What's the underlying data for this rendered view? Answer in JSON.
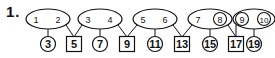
{
  "problem": {
    "number": "1."
  },
  "colors": {
    "ink": "#111111",
    "background": "#ffffff"
  },
  "ovals": [
    {
      "cx": 48,
      "left": "1",
      "right": "2",
      "left_circled": false,
      "right_circled": false
    },
    {
      "cx": 100,
      "left": "3",
      "right": "4",
      "left_circled": false,
      "right_circled": false
    },
    {
      "cx": 155,
      "left": "5",
      "right": "6",
      "left_circled": false,
      "right_circled": false
    },
    {
      "cx": 210,
      "left": "7",
      "right": "8",
      "left_circled": false,
      "right_circled": true
    },
    {
      "cx": 254,
      "left": "9",
      "right": "10",
      "left_circled": true,
      "right_circled": true
    }
  ],
  "sums": [
    {
      "value": "3",
      "shape": "circle",
      "x": 48
    },
    {
      "value": "5",
      "shape": "square",
      "x": 74
    },
    {
      "value": "7",
      "shape": "circle",
      "x": 100
    },
    {
      "value": "9",
      "shape": "square",
      "x": 127
    },
    {
      "value": "11",
      "shape": "circle",
      "x": 155
    },
    {
      "value": "13",
      "shape": "square",
      "x": 182
    },
    {
      "value": "15",
      "shape": "circle",
      "x": 210
    },
    {
      "value": "17",
      "shape": "square",
      "x": 236
    },
    {
      "value": "19",
      "shape": "circle",
      "x": 254
    }
  ]
}
